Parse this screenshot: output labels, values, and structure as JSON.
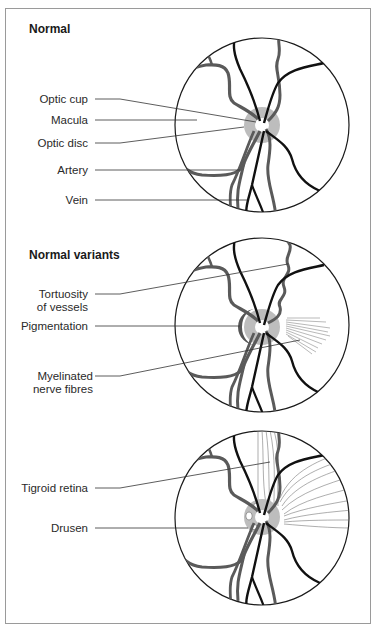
{
  "panels": [
    {
      "title": "Normal",
      "labels": [
        {
          "text": "Optic cup"
        },
        {
          "text": "Macula"
        },
        {
          "text": "Optic disc"
        },
        {
          "text": "Artery"
        },
        {
          "text": "Vein"
        }
      ]
    },
    {
      "title": "Normal variants",
      "labels": [
        {
          "text": "Tortuosity",
          "text2": "of vessels"
        },
        {
          "text": "Pigmentation"
        },
        {
          "text": "Myelinated",
          "text2": "nerve fibres"
        }
      ]
    },
    {
      "title": "",
      "labels": [
        {
          "text": "Tigroid retina"
        },
        {
          "text": "Drusen"
        }
      ]
    }
  ],
  "colors": {
    "vessel_artery": "#5a5a5a",
    "vessel_vein": "#111111",
    "disc_fill": "#bdbdbd",
    "pigment": "#555555",
    "leader_line": "#333333",
    "frame": "#9a9a9a"
  }
}
